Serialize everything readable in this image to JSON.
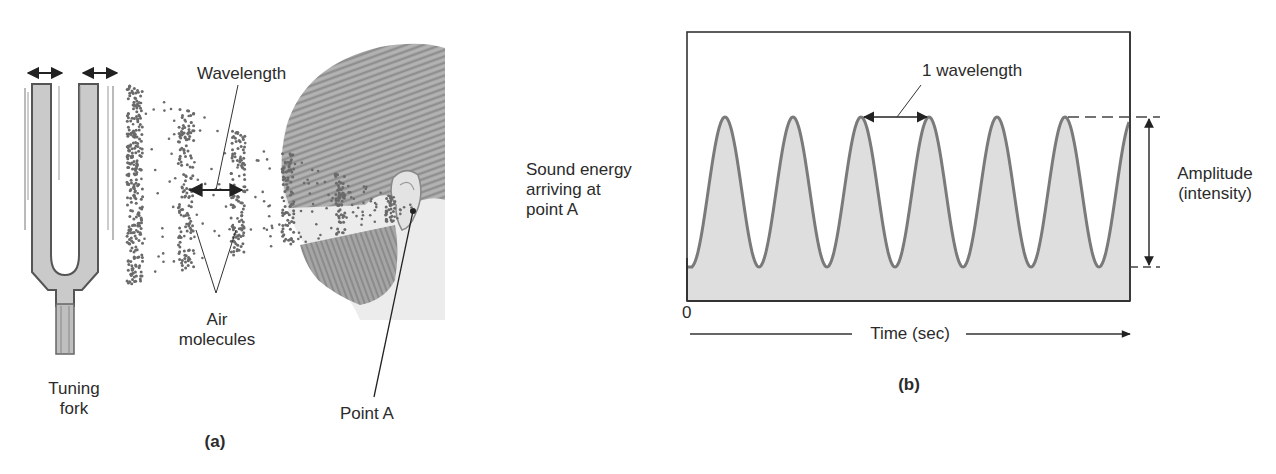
{
  "panel_a": {
    "caption": "(a)",
    "labels": {
      "wavelength": "Wavelength",
      "air_molecules_line1": "Air",
      "air_molecules_line2": "molecules",
      "tuning_fork_line1": "Tuning",
      "tuning_fork_line2": "fork",
      "point_a": "Point A"
    }
  },
  "panel_b": {
    "caption": "(b)",
    "y_label_lines": [
      "Sound energy",
      "arriving at",
      "point A"
    ],
    "wavelength_label": "1 wavelength",
    "amplitude_label_lines": [
      "Amplitude",
      "(intensity)"
    ],
    "origin_label": "0",
    "x_axis_label": "Time (sec)"
  },
  "colors": {
    "wave_stroke": "#7a7a7a",
    "wave_fill": "#dedede",
    "frame": "#333333",
    "fork_fill": "#c9c9c9",
    "fork_stroke": "#555555",
    "hair": "#8a8a8a",
    "skin": "#ececec",
    "molecule": "#6a6a6a"
  },
  "chart_data": {
    "type": "line",
    "title": "",
    "xlabel": "Time (sec)",
    "ylabel": "Sound energy arriving at point A",
    "x_origin_label": "0",
    "series": [
      {
        "name": "Sound wave (periodic)",
        "shape": "sinusoid",
        "cycles_visible": 6.5,
        "peaks_visible": 7,
        "troughs_visible": 6,
        "starts_at": "trough",
        "ends_at": "peak",
        "fill_under": true
      }
    ],
    "annotations": [
      "1 wavelength (peak-to-peak distance)",
      "Amplitude (intensity) (trough-to-peak height)"
    ],
    "grid": false,
    "legend": "none"
  }
}
